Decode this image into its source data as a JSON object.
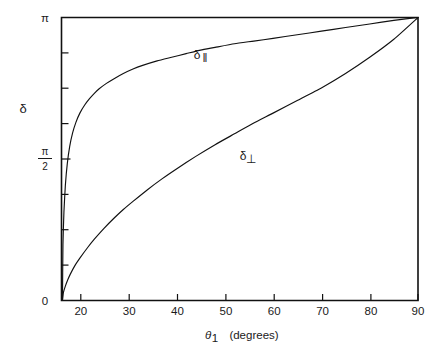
{
  "figure": {
    "background": "#ffffff",
    "ink_color": "#111111"
  },
  "chart_data": {
    "type": "line",
    "title": "",
    "subtitle": "",
    "xlabel": "θ₁ (degrees)",
    "xlabel_symbol": "θ",
    "xlabel_subscript": "1",
    "xlabel_units": "(degrees)",
    "ylabel": "δ",
    "xlim": [
      16.2,
      90
    ],
    "ylim": [
      0,
      3.141592653589793
    ],
    "ylim_labels": [
      "0",
      "π"
    ],
    "grid": false,
    "legend": "inline-annotations",
    "xticks": [
      20,
      30,
      40,
      50,
      60,
      70,
      80,
      90
    ],
    "xtick_labels": [
      "20",
      "30",
      "40",
      "50",
      "60",
      "70",
      "80",
      "90"
    ],
    "yticks": [
      0,
      0.3926990817,
      0.7853981634,
      1.1780972451,
      1.5707963268,
      1.9634954085,
      2.3561944902,
      2.7488935719,
      3.1415926536
    ],
    "ytick_labels": [
      "0",
      "",
      "",
      "",
      "π/2",
      "",
      "",
      "",
      "π"
    ],
    "ytick_label_top": "π",
    "ytick_label_mid_numerator": "π",
    "ytick_label_mid_denominator": "2",
    "ytick_label_bottom": "0",
    "annotations": [
      {
        "text": "δ∥",
        "symbol": "δ",
        "subscript": "‖",
        "x": 43.5,
        "y": 2.78
      },
      {
        "text": "δ⊥",
        "symbol": "δ",
        "subscript": "⊥",
        "x": 53.5,
        "y": 1.6
      }
    ],
    "critical_angle_deg": 16.4,
    "series": [
      {
        "name": "δ∥",
        "label": "δ parallel",
        "x": [
          16.4,
          16.5,
          16.7,
          17.0,
          17.4,
          17.9,
          18.5,
          19.2,
          20.0,
          21.0,
          22.0,
          23.0,
          24.0,
          25.5,
          27.0,
          29.0,
          31.0,
          33.0,
          36.0,
          39.0,
          42.0,
          45.0,
          48.0,
          52.0,
          56.0,
          60.0,
          65.0,
          70.0,
          75.0,
          80.0,
          85.0,
          90.0
        ],
        "y": [
          0.0,
          0.62,
          0.98,
          1.28,
          1.52,
          1.71,
          1.86,
          1.98,
          2.08,
          2.17,
          2.24,
          2.3,
          2.35,
          2.41,
          2.46,
          2.52,
          2.57,
          2.61,
          2.66,
          2.7,
          2.74,
          2.78,
          2.81,
          2.85,
          2.88,
          2.91,
          2.95,
          2.99,
          3.03,
          3.07,
          3.11,
          3.1416
        ]
      },
      {
        "name": "δ⊥",
        "label": "δ perpendicular",
        "x": [
          16.4,
          16.6,
          17.0,
          17.5,
          18.0,
          19.0,
          20.0,
          21.5,
          23.0,
          25.0,
          27.0,
          29.0,
          31.0,
          34.0,
          37.0,
          40.0,
          44.0,
          48.0,
          52.0,
          56.0,
          60.0,
          65.0,
          70.0,
          75.0,
          80.0,
          85.0,
          90.0
        ],
        "y": [
          0.0,
          0.09,
          0.16,
          0.23,
          0.29,
          0.39,
          0.47,
          0.58,
          0.68,
          0.8,
          0.91,
          1.01,
          1.1,
          1.23,
          1.35,
          1.46,
          1.6,
          1.73,
          1.85,
          1.97,
          2.08,
          2.22,
          2.36,
          2.52,
          2.7,
          2.9,
          3.1416
        ]
      }
    ]
  }
}
